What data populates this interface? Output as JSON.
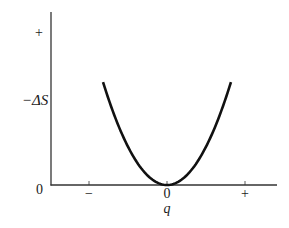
{
  "chart_data": {
    "type": "line",
    "title": "",
    "xlabel": "q",
    "ylabel": "−ΔS",
    "x_ticks": [
      {
        "value": -1,
        "label": "−"
      },
      {
        "value": 0,
        "label": "0"
      },
      {
        "value": 1,
        "label": "+"
      }
    ],
    "y_ticks": [
      {
        "value": 0,
        "label": "0"
      },
      {
        "value": 1,
        "label": "+"
      }
    ],
    "xlim": [
      -1.5,
      1.4
    ],
    "ylim": [
      0,
      1.05
    ],
    "grid": false,
    "legend": null,
    "series": [
      {
        "name": "−ΔS vs q",
        "color": "#111111",
        "equation": "y = q^2",
        "x": [
          -0.82,
          -0.6,
          -0.4,
          -0.2,
          0,
          0.2,
          0.4,
          0.6,
          0.82
        ],
        "y": [
          0.6724,
          0.36,
          0.16,
          0.04,
          0,
          0.04,
          0.16,
          0.36,
          0.6724
        ]
      }
    ]
  }
}
